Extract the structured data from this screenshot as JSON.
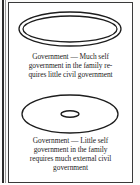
{
  "figure": {
    "background_color": "#ffffff",
    "border_color": "#3a3a3a",
    "ink_color": "#1d1d1d",
    "rule_color": "#2b2b2b"
  },
  "diagrams": [
    {
      "name": "much-self-government",
      "shape": "concentric-ellipses",
      "description": "Large outer ellipse with a second ellipse just inside it, leaving a thin ring",
      "outer_ellipse": {
        "cx": 61,
        "cy": 20,
        "rx": 51,
        "ry": 17
      },
      "inner_ellipse": {
        "cx": 61,
        "cy": 20,
        "rx": 47,
        "ry": 13
      },
      "caption_lines": [
        "Government — Much self",
        "government in the family re-",
        "quires little civil government"
      ],
      "caption_text": "Government — Much self government in the family requires little civil government"
    },
    {
      "name": "little-self-government",
      "shape": "ellipse-with-small-center-ellipse",
      "description": "Large outer ellipse with a very small ellipse at its center",
      "outer_ellipse": {
        "cx": 61,
        "cy": 21,
        "rx": 48,
        "ry": 19
      },
      "inner_ellipse": {
        "cx": 61,
        "cy": 21,
        "rx": 9,
        "ry": 3.2
      },
      "caption_lines": [
        "Government — Little self",
        "government in the family",
        "requires much external civil",
        "government"
      ],
      "caption_text": "Government — Little self government in the family requires much external civil government"
    }
  ]
}
